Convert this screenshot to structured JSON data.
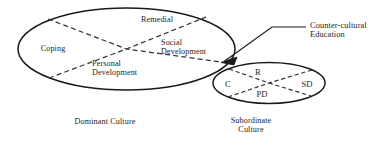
{
  "diagram": {
    "ink_color": "#1a1a1a",
    "dash_color": "#333333",
    "background": "#ffffff",
    "dominant_ellipse": {
      "caption": "Dominant Culture",
      "quadrants": {
        "top": "Remedial",
        "left": "Coping",
        "right": "Social\nDevelopment",
        "bottom": "Personal\nDevelopment"
      }
    },
    "subordinate_ellipse": {
      "caption": "Subordinate\nCulture",
      "quadrants": {
        "top": "R",
        "left": "C",
        "right": "SD",
        "bottom": "PD"
      }
    },
    "callout": {
      "label": "Counter-cultural\nEducation"
    }
  }
}
